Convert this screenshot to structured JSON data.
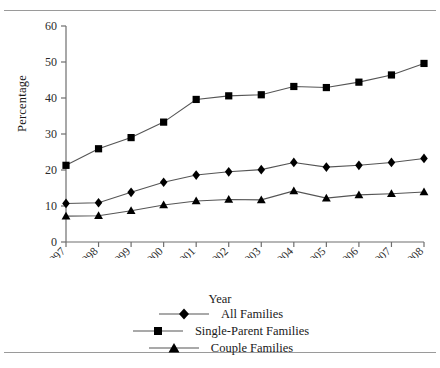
{
  "chart_data": {
    "type": "line",
    "title": "",
    "xlabel": "Year",
    "ylabel": "Percentage",
    "categories": [
      "1997",
      "1998",
      "1999",
      "2000",
      "2001",
      "2002",
      "2003",
      "2004",
      "2005",
      "2006",
      "2007",
      "2008"
    ],
    "ylim": [
      0,
      60
    ],
    "yticks": [
      0,
      10,
      20,
      30,
      40,
      50,
      60
    ],
    "grid": false,
    "legend_position": "bottom",
    "series": [
      {
        "name": "All Families",
        "marker": "diamond",
        "values": [
          10.7,
          10.9,
          13.8,
          16.6,
          18.6,
          19.5,
          20.1,
          22.1,
          20.8,
          21.3,
          22.1,
          23.2
        ]
      },
      {
        "name": "Single-Parent Families",
        "marker": "square",
        "values": [
          21.3,
          25.9,
          29.0,
          33.3,
          39.6,
          40.6,
          40.9,
          43.2,
          42.9,
          44.4,
          46.4,
          49.6
        ]
      },
      {
        "name": "Couple Families",
        "marker": "triangle",
        "values": [
          7.2,
          7.3,
          8.7,
          10.3,
          11.4,
          11.8,
          11.7,
          14.2,
          12.2,
          13.1,
          13.4,
          13.9
        ]
      }
    ]
  },
  "colors": {
    "series": "#000000",
    "axis": "#6e6e6e",
    "rule": "#9a9a9a",
    "text": "#2b2b2b"
  }
}
